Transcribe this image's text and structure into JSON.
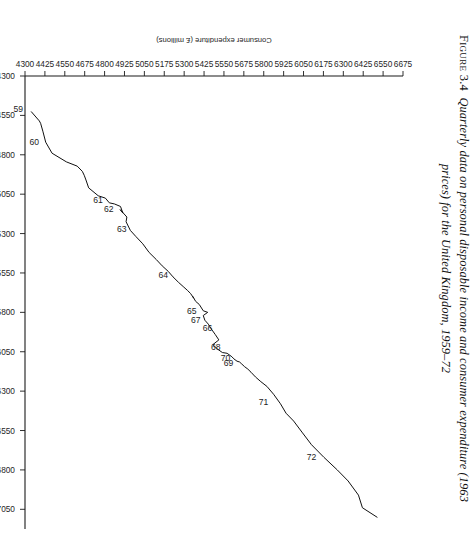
{
  "figure": {
    "number_label": "Figure 3.4",
    "caption_line1": "Quarterly data on personal disposable income and consumer expenditure (1963",
    "caption_line2": "prices) for the United Kingdom, 1959–72",
    "ink_color": "#111111",
    "paper_color": "#ffffff"
  },
  "chart_data": {
    "type": "line",
    "title": "",
    "subtitle": "",
    "xlabel": "Personal disposable income (£ millions)",
    "ylabel": "Consumer expenditure (£ millions)",
    "xlim": [
      4300,
      7175
    ],
    "ylim": [
      4300,
      6675
    ],
    "xticks": [
      4300,
      4550,
      4800,
      5050,
      5300,
      5550,
      5800,
      6050,
      6300,
      6550,
      6800,
      7050
    ],
    "xticklabels": [
      "4300",
      "4550",
      "4800",
      "5050",
      "5300",
      "5550",
      "5800",
      "6050",
      "6300",
      "6550",
      "6800",
      "7050"
    ],
    "yticks": [
      4300,
      4425,
      4550,
      4675,
      4800,
      4925,
      5050,
      5175,
      5300,
      5425,
      5550,
      5675,
      5800,
      5925,
      6050,
      6175,
      6300,
      6425,
      6550,
      6675
    ],
    "yticklabels": [
      "4300",
      "4425",
      "4550",
      "4675",
      "4800",
      "4925",
      "5050",
      "5175",
      "5300",
      "5425",
      "5550",
      "5675",
      "5800",
      "5925",
      "6050",
      "6175",
      "6300",
      "6425",
      "6550",
      "6675"
    ],
    "grid": false,
    "legend": false,
    "orientation": "rotated-90-clockwise-on-page",
    "marker": "none",
    "series": [
      {
        "name": "UK quarterly income vs expenditure 1959-72",
        "x": [
          4527,
          4585,
          4600,
          4650,
          4720,
          4790,
          4845,
          4872,
          4905,
          4930,
          4960,
          5010,
          5060,
          5075,
          5105,
          5112,
          5128,
          5170,
          5148,
          5195,
          5225,
          5280,
          5318,
          5365,
          5420,
          5465,
          5505,
          5540,
          5575,
          5610,
          5640,
          5660,
          5680,
          5710,
          5700,
          5730,
          5750,
          5790,
          5800,
          5820,
          5850,
          5875,
          5905,
          5940,
          5975,
          6005,
          6035,
          6055,
          6060,
          6082,
          6095,
          6110,
          6115,
          6128,
          6145,
          6160,
          6180,
          6210,
          6240,
          6270,
          6320,
          6380,
          6440,
          6490,
          6560,
          6640,
          6720,
          6800,
          6870,
          6960,
          7040,
          7100
        ],
        "y": [
          4340,
          4390,
          4398,
          4412,
          4430,
          4470,
          4560,
          4628,
          4660,
          4672,
          4683,
          4700,
          4760,
          4805,
          4830,
          4862,
          4900,
          4915,
          4898,
          4940,
          4935,
          4962,
          4996,
          5040,
          5080,
          5125,
          5162,
          5200,
          5230,
          5265,
          5298,
          5320,
          5340,
          5360,
          5355,
          5372,
          5395,
          5420,
          5448,
          5420,
          5430,
          5452,
          5470,
          5495,
          5518,
          5480,
          5512,
          5540,
          5570,
          5600,
          5612,
          5632,
          5648,
          5662,
          5680,
          5700,
          5720,
          5748,
          5782,
          5820,
          5862,
          5905,
          5940,
          5988,
          6040,
          6100,
          6178,
          6262,
          6330,
          6395,
          6420,
          6512
        ]
      }
    ],
    "annotations": [
      {
        "label": "59",
        "x": 4527,
        "y": 4340
      },
      {
        "label": "60",
        "x": 4740,
        "y": 4440
      },
      {
        "label": "61",
        "x": 5105,
        "y": 4840
      },
      {
        "label": "62",
        "x": 5160,
        "y": 4908
      },
      {
        "label": "63",
        "x": 5290,
        "y": 4990
      },
      {
        "label": "64",
        "x": 5580,
        "y": 5250
      },
      {
        "label": "65",
        "x": 5810,
        "y": 5430
      },
      {
        "label": "66",
        "x": 5920,
        "y": 5528
      },
      {
        "label": "67",
        "x": 5870,
        "y": 5455
      },
      {
        "label": "68",
        "x": 6040,
        "y": 5580
      },
      {
        "label": "69",
        "x": 6140,
        "y": 5660
      },
      {
        "label": "70",
        "x": 6110,
        "y": 5642
      },
      {
        "label": "71",
        "x": 6390,
        "y": 5880
      },
      {
        "label": "72",
        "x": 6740,
        "y": 6182
      }
    ]
  },
  "axes": {
    "x_axis_name": "x-axis-income",
    "y_axis_name": "y-axis-expenditure"
  }
}
